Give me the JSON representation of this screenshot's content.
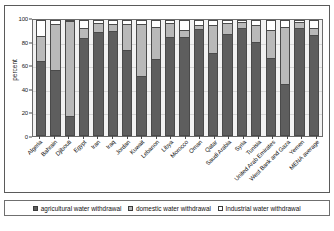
{
  "chart_data": {
    "type": "bar",
    "stacked": true,
    "title": "",
    "xlabel": "",
    "ylabel": "percent",
    "ylim": [
      0,
      100
    ],
    "yticks": [
      0,
      20,
      40,
      60,
      80,
      100
    ],
    "grid": true,
    "legend_position": "bottom",
    "categories": [
      "Algeria",
      "Bahrain",
      "Djibouti",
      "Egypt",
      "Iran",
      "Iraq",
      "Jordan",
      "Kuwait",
      "Lebanon",
      "Libya",
      "Morocco",
      "Oman",
      "Qatar",
      "Saudi Arabia",
      "Syria",
      "Tunisia",
      "United Arab Emirates",
      "West Bank and Gaza",
      "Yemen",
      "MENA average"
    ],
    "series": [
      {
        "name": "agricultural water withdrawal",
        "color": "#5e5e5e",
        "values": [
          65,
          57,
          16,
          86,
          91,
          92,
          75,
          52,
          67,
          87,
          87,
          94,
          72,
          89,
          95,
          82,
          68,
          45,
          95,
          88
        ]
      },
      {
        "name": "domestic water withdrawal",
        "color": "#b9b9b9",
        "values": [
          22,
          40,
          84,
          8,
          7,
          5,
          22,
          45,
          28,
          11,
          5,
          2,
          24,
          9,
          4,
          14,
          24,
          50,
          4,
          6
        ]
      },
      {
        "name": "Industrial water withdrawal",
        "color": "#ffffff",
        "values": [
          13,
          3,
          0,
          6,
          2,
          3,
          3,
          3,
          5,
          2,
          8,
          4,
          4,
          2,
          1,
          4,
          8,
          5,
          1,
          6
        ]
      }
    ]
  },
  "legend": {
    "items": [
      {
        "label": "agricultural water withdrawal",
        "swatch": "sw-agr"
      },
      {
        "label": "domestic water withdrawal",
        "swatch": "sw-dom"
      },
      {
        "label": "Industrial water withdrawal",
        "swatch": "sw-ind"
      }
    ]
  }
}
